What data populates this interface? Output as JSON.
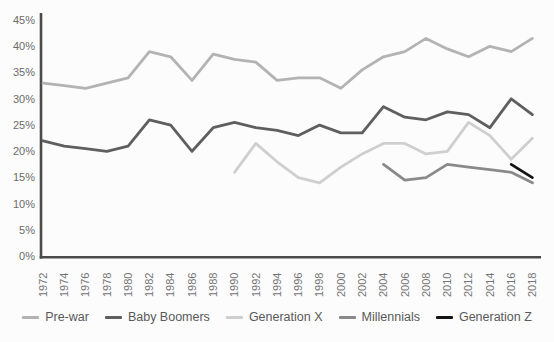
{
  "figure": {
    "background": "#fcfcfc",
    "axis_color": "#4a4a4a",
    "y_tick_label_color": "#6b6b6b",
    "x_tick_label_color": "#757575",
    "legend_text_color": "#595959"
  },
  "chart_data": {
    "type": "line",
    "title": "",
    "xlabel": "",
    "ylabel": "",
    "grid": false,
    "legend_position": "bottom",
    "ylim": [
      0,
      45
    ],
    "y_ticks": [
      0,
      5,
      10,
      15,
      20,
      25,
      30,
      35,
      40,
      45
    ],
    "y_tick_suffix": "%",
    "categories": [
      "1972",
      "1974",
      "1976",
      "1978",
      "1980",
      "1982",
      "1984",
      "1986",
      "1988",
      "1990",
      "1992",
      "1994",
      "1996",
      "1998",
      "2000",
      "2002",
      "2004",
      "2006",
      "2008",
      "2010",
      "2012",
      "2014",
      "2016",
      "2018"
    ],
    "series": [
      {
        "name": "Pre-war",
        "color": "#b3b3b3",
        "values": [
          33,
          32.5,
          32,
          33,
          34,
          39,
          38,
          33.5,
          38.5,
          37.5,
          37,
          33.5,
          34,
          34,
          32,
          35.5,
          38,
          39,
          41.5,
          39.5,
          38,
          40,
          39,
          41.5
        ]
      },
      {
        "name": "Baby Boomers",
        "color": "#5f5f5f",
        "values": [
          22,
          21,
          20.5,
          20,
          21,
          26,
          25,
          20,
          24.5,
          25.5,
          24.5,
          24,
          23,
          25,
          23.5,
          23.5,
          28.5,
          26.5,
          26,
          27.5,
          27,
          24.5,
          30,
          27
        ]
      },
      {
        "name": "Generation X",
        "color": "#cfcfcf",
        "values": [
          null,
          null,
          null,
          null,
          null,
          null,
          null,
          null,
          null,
          16,
          21.5,
          18,
          15,
          14,
          17,
          19.5,
          21.5,
          21.5,
          19.5,
          20,
          25.5,
          23,
          18.5,
          22.5
        ]
      },
      {
        "name": "Millennials",
        "color": "#8a8a8a",
        "values": [
          null,
          null,
          null,
          null,
          null,
          null,
          null,
          null,
          null,
          null,
          null,
          null,
          null,
          null,
          null,
          null,
          17.5,
          14.5,
          15,
          17.5,
          17,
          16.5,
          16,
          14
        ]
      },
      {
        "name": "Generation Z",
        "color": "#141414",
        "values": [
          null,
          null,
          null,
          null,
          null,
          null,
          null,
          null,
          null,
          null,
          null,
          null,
          null,
          null,
          null,
          null,
          null,
          null,
          null,
          null,
          null,
          null,
          17.5,
          15
        ]
      }
    ]
  }
}
